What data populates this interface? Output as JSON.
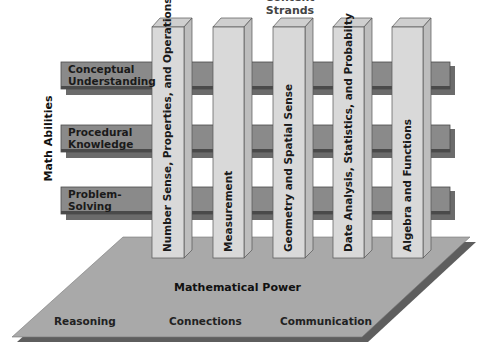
{
  "diagram": {
    "top_title": "Content Strands",
    "axis_label": "Math Abilities",
    "abilities": [
      {
        "line1": "Conceptual",
        "line2": "Understanding"
      },
      {
        "line1": "Procedural",
        "line2": "Knowledge"
      },
      {
        "line1": "Problem-",
        "line2": "Solving"
      }
    ],
    "strands": [
      "Number Sense, Properties, and Operations",
      "Measurement",
      "Geometry and Spatial Sense",
      "Date Analysis, Statistics, and Probabilty",
      "Algebra and Functions"
    ],
    "platform": {
      "title": "Mathematical Power",
      "labels": [
        "Reasoning",
        "Connections",
        "Communication"
      ]
    },
    "colors": {
      "bar_fill": "#8a8a8a",
      "bar_edge": "#4a4a4a",
      "bar_shadow": "#6b6b6b",
      "pillar_front": "#d9d9d9",
      "pillar_side": "#bdbdbd",
      "pillar_top": "#cfcfcf",
      "platform": "#a9a9a9",
      "platform_shadow": "#5e5e5e"
    }
  }
}
